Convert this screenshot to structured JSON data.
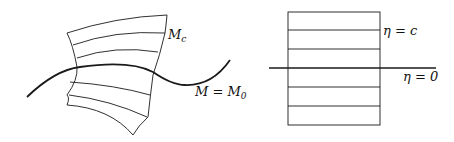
{
  "left_figure": {
    "patch_label": {
      "base": "M",
      "sub": "c"
    },
    "curve_label": {
      "lhs": "M",
      "eq": " = ",
      "rhs_base": "M",
      "rhs_sub": "0"
    }
  },
  "right_figure": {
    "level_label": "η = c",
    "axis_label": "η = 0"
  },
  "colors": {
    "stroke": "#1a1a1a",
    "background": "#ffffff"
  }
}
